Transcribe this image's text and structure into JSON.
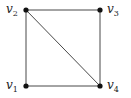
{
  "graph": {
    "nodes": [
      {
        "id": "v1",
        "label": "v",
        "sub": "1",
        "x": 26,
        "y": 86,
        "lx": 6,
        "ly": 79
      },
      {
        "id": "v2",
        "label": "v",
        "sub": "2",
        "x": 26,
        "y": 10,
        "lx": 6,
        "ly": 3
      },
      {
        "id": "v3",
        "label": "v",
        "sub": "3",
        "x": 100,
        "y": 10,
        "lx": 107,
        "ly": 3
      },
      {
        "id": "v4",
        "label": "v",
        "sub": "4",
        "x": 100,
        "y": 86,
        "lx": 107,
        "ly": 79
      }
    ],
    "edges": [
      [
        "v1",
        "v2"
      ],
      [
        "v2",
        "v3"
      ],
      [
        "v3",
        "v4"
      ],
      [
        "v1",
        "v4"
      ],
      [
        "v2",
        "v4"
      ]
    ],
    "colors": {
      "edge": "#333333",
      "node": "#111111"
    }
  }
}
